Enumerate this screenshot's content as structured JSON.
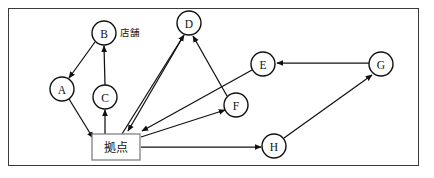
{
  "figure": {
    "title": "",
    "canvas": {
      "width": 434,
      "height": 178
    },
    "border": {
      "x": 8,
      "y": 8,
      "width": 411,
      "height": 158,
      "color": "#3a3a3a"
    },
    "stroke_color": "#111111",
    "node_fill": "#ffffff",
    "hub_border_color": "#777777"
  },
  "nodes": [
    {
      "id": "A",
      "label": "A",
      "cx": 62,
      "cy": 89,
      "r": 12,
      "shape": "circle"
    },
    {
      "id": "B",
      "label": "B",
      "cx": 104,
      "cy": 33,
      "r": 12,
      "shape": "circle"
    },
    {
      "id": "C",
      "label": "C",
      "cx": 105,
      "cy": 97,
      "r": 12,
      "shape": "circle"
    },
    {
      "id": "D",
      "label": "D",
      "cx": 189,
      "cy": 23,
      "r": 12,
      "shape": "circle"
    },
    {
      "id": "E",
      "label": "E",
      "cx": 263,
      "cy": 64,
      "r": 12,
      "shape": "circle"
    },
    {
      "id": "F",
      "label": "F",
      "cx": 236,
      "cy": 105,
      "r": 12,
      "shape": "circle"
    },
    {
      "id": "G",
      "label": "G",
      "cx": 381,
      "cy": 64,
      "r": 12,
      "shape": "circle"
    },
    {
      "id": "H",
      "label": "H",
      "cx": 274,
      "cy": 146,
      "r": 12,
      "shape": "circle"
    }
  ],
  "hub": {
    "id": "HUB",
    "label": "拠点",
    "x": 92,
    "y": 134,
    "width": 48,
    "height": 26,
    "shape": "rect"
  },
  "annotations": [
    {
      "id": "store-label",
      "text": "店舗",
      "x": 120,
      "y": 32
    }
  ],
  "edges": [
    {
      "id": "B-A",
      "from": "B",
      "to": "A",
      "x1": 95,
      "y1": 42,
      "x2": 69,
      "y2": 78,
      "arrow": "end"
    },
    {
      "id": "C-B",
      "from": "C",
      "to": "B",
      "x1": 105,
      "y1": 85,
      "x2": 104,
      "y2": 46,
      "arrow": "end"
    },
    {
      "id": "A-HUB",
      "from": "A",
      "to": "HUB",
      "x1": 69,
      "y1": 99,
      "x2": 93,
      "y2": 138,
      "arrow": "end"
    },
    {
      "id": "HUB-C",
      "from": "HUB",
      "to": "C",
      "x1": 105,
      "y1": 134,
      "x2": 105,
      "y2": 110,
      "arrow": "end"
    },
    {
      "id": "HUB-D",
      "from": "HUB",
      "to": "D",
      "x1": 122,
      "y1": 134,
      "x2": 184,
      "y2": 35,
      "arrow": "end"
    },
    {
      "id": "D-HUB",
      "from": "D",
      "to": "HUB",
      "x1": 184,
      "y1": 35,
      "x2": 128,
      "y2": 131,
      "arrow": "end"
    },
    {
      "id": "F-D",
      "from": "F",
      "to": "D",
      "x1": 227,
      "y1": 96,
      "x2": 193,
      "y2": 36,
      "arrow": "end"
    },
    {
      "id": "E-HUB",
      "from": "E",
      "to": "HUB",
      "x1": 252,
      "y1": 70,
      "x2": 142,
      "y2": 131,
      "arrow": "end"
    },
    {
      "id": "HUB-F",
      "from": "HUB",
      "to": "F",
      "x1": 141,
      "y1": 137,
      "x2": 225,
      "y2": 110,
      "arrow": "end"
    },
    {
      "id": "HUB-H",
      "from": "HUB",
      "to": "H",
      "x1": 141,
      "y1": 147,
      "x2": 261,
      "y2": 147,
      "arrow": "end"
    },
    {
      "id": "H-G",
      "from": "H",
      "to": "G",
      "x1": 284,
      "y1": 138,
      "x2": 372,
      "y2": 75,
      "arrow": "end"
    },
    {
      "id": "G-E",
      "from": "G",
      "to": "E",
      "x1": 369,
      "y1": 63,
      "x2": 277,
      "y2": 63,
      "arrow": "end"
    }
  ]
}
